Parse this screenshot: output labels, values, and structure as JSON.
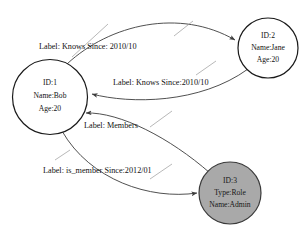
{
  "diagram": {
    "type": "property-graph",
    "background_color": "#ffffff",
    "stroke_color": "#3c3c3c",
    "node_fill_default": "#ffffff",
    "node_fill_highlight": "#a9a9a9",
    "nodes": [
      {
        "id": "node-1",
        "cx": 50,
        "cy": 97,
        "r": 37.5,
        "filled": false,
        "lines": [
          "ID:1",
          "Name:Bob",
          "Age:20"
        ]
      },
      {
        "id": "node-2",
        "cx": 268,
        "cy": 48,
        "r": 30,
        "filled": false,
        "lines": [
          "ID:2",
          "Name:Jane",
          "Age:20"
        ]
      },
      {
        "id": "node-3",
        "cx": 230,
        "cy": 193,
        "r": 31,
        "filled": true,
        "lines": [
          "ID:3",
          "Type:Role",
          "Name:Admin"
        ]
      }
    ],
    "edges": [
      {
        "id": "edge-knows-out",
        "from": "node-1",
        "to": "node-2",
        "label": "Label: Knows Since: 2010/10"
      },
      {
        "id": "edge-knows-in",
        "from": "node-2",
        "to": "node-1",
        "label": "Label: Knows Since:2010/10"
      },
      {
        "id": "edge-members",
        "from": "node-3",
        "to": "node-1",
        "label": "Label: Members"
      },
      {
        "id": "edge-is-member",
        "from": "node-1",
        "to": "node-3",
        "label": "Label: is_member Since:2012/01"
      }
    ]
  }
}
